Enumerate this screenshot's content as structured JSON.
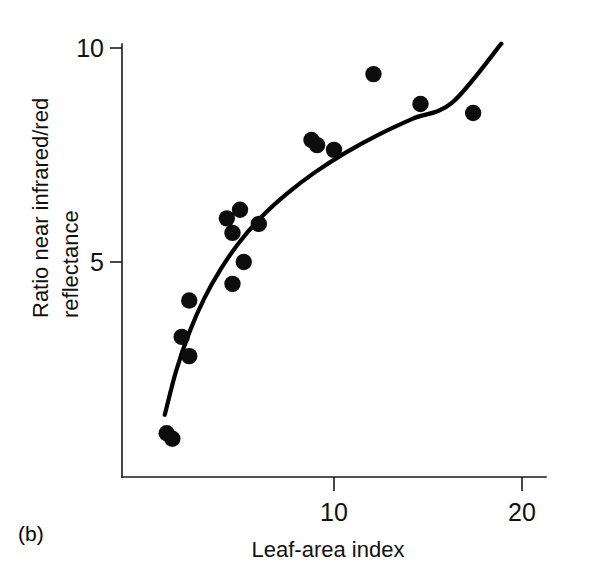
{
  "panel": {
    "label": "(b)"
  },
  "chart_data": {
    "type": "scatter",
    "title": "",
    "xlabel": "Leaf-area index",
    "ylabel": "Ratio near infrared/red reflectance",
    "ylabel_lines": [
      "Ratio near infrared/red",
      "reflectance"
    ],
    "xlim": [
      0,
      21.2
    ],
    "ylim": [
      0,
      11.1
    ],
    "xticks": [
      10,
      20
    ],
    "xtick_labels": [
      "10",
      "20"
    ],
    "yticks": [
      5,
      10
    ],
    "ytick_labels": [
      "5",
      "10"
    ],
    "grid": false,
    "legend": null,
    "marker": "filled-circle",
    "marker_color": "#0d0d0d",
    "curve_color": "#000000",
    "points": [
      {
        "x": 1.1,
        "y": 1.0
      },
      {
        "x": 1.4,
        "y": 0.87
      },
      {
        "x": 1.9,
        "y": 3.25
      },
      {
        "x": 2.3,
        "y": 4.1
      },
      {
        "x": 2.3,
        "y": 2.8
      },
      {
        "x": 4.3,
        "y": 6.02
      },
      {
        "x": 5.0,
        "y": 6.22
      },
      {
        "x": 4.6,
        "y": 5.68
      },
      {
        "x": 6.0,
        "y": 5.89
      },
      {
        "x": 5.2,
        "y": 5.0
      },
      {
        "x": 4.6,
        "y": 4.49
      },
      {
        "x": 8.8,
        "y": 7.85
      },
      {
        "x": 9.1,
        "y": 7.73
      },
      {
        "x": 10.0,
        "y": 7.62
      },
      {
        "x": 12.1,
        "y": 9.39
      },
      {
        "x": 14.6,
        "y": 8.69
      },
      {
        "x": 17.4,
        "y": 8.48
      }
    ],
    "fit_curve": {
      "description": "saturating logarithmic trend line",
      "x_start": 1.0,
      "x_end": 18.9,
      "points": [
        {
          "x": 1.0,
          "y": 1.43
        },
        {
          "x": 1.6,
          "y": 2.45
        },
        {
          "x": 2.3,
          "y": 3.35
        },
        {
          "x": 3.1,
          "y": 4.15
        },
        {
          "x": 4.0,
          "y": 4.85
        },
        {
          "x": 5.0,
          "y": 5.48
        },
        {
          "x": 6.2,
          "y": 6.08
        },
        {
          "x": 7.5,
          "y": 6.6
        },
        {
          "x": 9.0,
          "y": 7.1
        },
        {
          "x": 10.6,
          "y": 7.55
        },
        {
          "x": 12.3,
          "y": 7.96
        },
        {
          "x": 14.2,
          "y": 8.35
        },
        {
          "x": 16.3,
          "y": 8.73
        },
        {
          "x": 18.9,
          "y": 10.1
        }
      ]
    }
  }
}
